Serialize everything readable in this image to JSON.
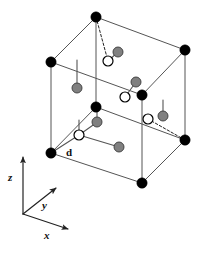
{
  "figure": {
    "name": "cubic-unit-cell-diagram",
    "background": "#ffffff",
    "width": 199,
    "height": 254
  },
  "colors": {
    "edge": "#555555",
    "atom_corner": "#000000",
    "atom_gray_fill": "#808080",
    "atom_gray_stroke": "#3a3a3a",
    "atom_open_fill": "#ffffff",
    "atom_open_stroke": "#000000",
    "axis": "#222222",
    "text": "#111111"
  },
  "cube": {
    "name": "unit-cell-cube",
    "vertices": {
      "top_back": [
        96,
        17
      ],
      "top_left": [
        51,
        62
      ],
      "top_right": [
        185,
        50
      ],
      "top_front": [
        142,
        95
      ],
      "bottom_back": [
        96,
        107
      ],
      "bottom_left": [
        51,
        153
      ],
      "bottom_right": [
        185,
        140
      ],
      "bottom_front": [
        142,
        183
      ]
    },
    "solid_edges": [
      [
        "top_back",
        "top_left"
      ],
      [
        "top_back",
        "top_right"
      ],
      [
        "top_left",
        "top_front"
      ],
      [
        "top_right",
        "top_front"
      ],
      [
        "top_left",
        "bottom_left"
      ],
      [
        "top_right",
        "bottom_right"
      ],
      [
        "top_front",
        "bottom_front"
      ],
      [
        "top_back",
        "bottom_back"
      ],
      [
        "bottom_back",
        "bottom_left"
      ],
      [
        "bottom_back",
        "bottom_right"
      ],
      [
        "bottom_left",
        "bottom_front"
      ],
      [
        "bottom_right",
        "bottom_front"
      ]
    ]
  },
  "atoms": {
    "corner": {
      "label": "corner-atom",
      "radius": 5.2,
      "positions": [
        [
          96,
          17
        ],
        [
          51,
          62
        ],
        [
          185,
          50
        ],
        [
          142,
          95
        ],
        [
          96,
          107
        ],
        [
          51,
          153
        ],
        [
          185,
          140
        ],
        [
          142,
          183
        ]
      ]
    },
    "gray": {
      "label": "gray-atom",
      "radius": 5.0,
      "positions": [
        [
          118,
          52
        ],
        [
          77,
          88
        ],
        [
          136,
          82
        ],
        [
          97,
          122
        ],
        [
          163,
          116
        ],
        [
          119,
          147
        ]
      ]
    },
    "open": {
      "label": "open-atom",
      "radius": 5.0,
      "positions": [
        [
          108,
          61
        ],
        [
          125,
          97
        ],
        [
          148,
          119
        ],
        [
          79,
          135
        ]
      ]
    }
  },
  "bonds": {
    "dashed": [
      {
        "name": "bond-dashed-top",
        "from": [
          96,
          17
        ],
        "to": [
          108,
          61
        ]
      },
      {
        "name": "bond-dashed-right",
        "from": [
          185,
          140
        ],
        "to": [
          148,
          119
        ]
      }
    ],
    "solid": [
      {
        "name": "bond-gray-top",
        "from": [
          108,
          61
        ],
        "to": [
          118,
          52
        ]
      },
      {
        "name": "bond-gray-left",
        "from": [
          77,
          88
        ],
        "to": [
          77,
          60
        ]
      },
      {
        "name": "bond-gray-mid",
        "from": [
          136,
          82
        ],
        "to": [
          125,
          97
        ]
      },
      {
        "name": "bond-gray-vert",
        "from": [
          97,
          122
        ],
        "to": [
          97,
          107
        ]
      },
      {
        "name": "bond-d",
        "from": [
          51,
          153
        ],
        "to": [
          79,
          135
        ]
      },
      {
        "name": "bond-open-up",
        "from": [
          79,
          135
        ],
        "to": [
          96,
          123
        ]
      },
      {
        "name": "bond-open-right",
        "from": [
          79,
          135
        ],
        "to": [
          119,
          147
        ]
      },
      {
        "name": "bond-open-vert",
        "from": [
          79,
          135
        ],
        "to": [
          79,
          120
        ]
      },
      {
        "name": "bond-gray-right",
        "from": [
          163,
          116
        ],
        "to": [
          163,
          100
        ]
      }
    ]
  },
  "bond_label": {
    "name": "bond-length-label-d",
    "text": "d",
    "x": 66,
    "y": 147
  },
  "axes": {
    "name": "coordinate-axes",
    "origin": [
      23,
      214
    ],
    "items": [
      {
        "name": "axis-z",
        "label": "z",
        "tip": [
          23,
          157
        ],
        "label_x": 8,
        "label_y": 172
      },
      {
        "name": "axis-y",
        "label": "y",
        "tip": [
          56,
          188
        ],
        "label_x": 42,
        "label_y": 200
      },
      {
        "name": "axis-x",
        "label": "x",
        "tip": [
          68,
          229
        ],
        "label_x": 44,
        "label_y": 230
      }
    ]
  }
}
